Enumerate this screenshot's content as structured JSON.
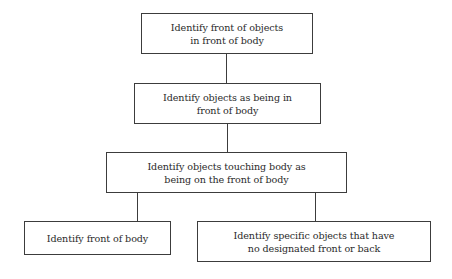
{
  "diagram": {
    "type": "hierarchy-flowchart",
    "nodes": [
      {
        "id": "n1",
        "lines": [
          "Identify front of objects",
          "in front of body"
        ]
      },
      {
        "id": "n2",
        "lines": [
          "Identify objects as being in",
          "front of body"
        ]
      },
      {
        "id": "n3",
        "lines": [
          "Identify objects touching body as",
          "being on the front of body"
        ]
      },
      {
        "id": "n4",
        "lines": [
          "Identify front of body"
        ]
      },
      {
        "id": "n5",
        "lines": [
          "Identify specific objects that have",
          "no designated front or back"
        ]
      }
    ],
    "edges": [
      {
        "from": "n1",
        "to": "n2"
      },
      {
        "from": "n2",
        "to": "n3"
      },
      {
        "from": "n3",
        "to": "n4"
      },
      {
        "from": "n3",
        "to": "n5"
      }
    ],
    "colors": {
      "stroke": "#3c3c3c",
      "text": "#2a2a2a",
      "background": "#ffffff"
    }
  }
}
